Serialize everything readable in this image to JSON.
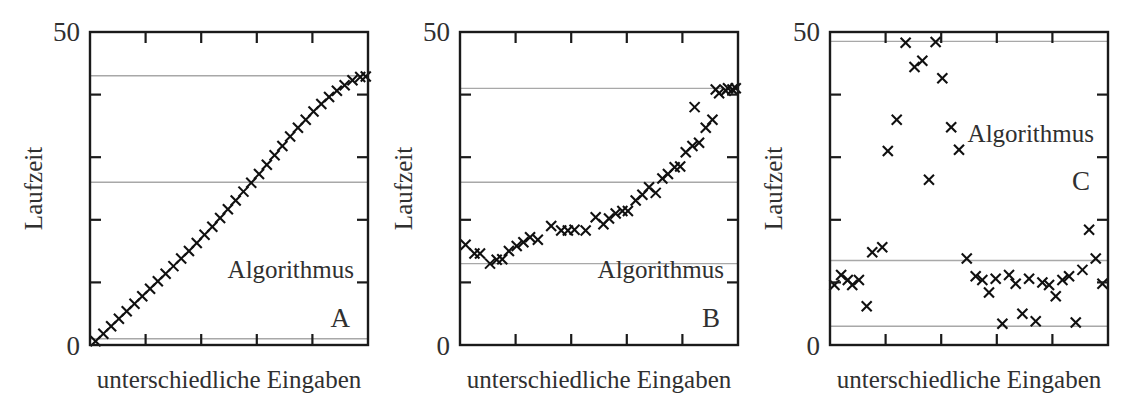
{
  "figure": {
    "panel_count": 3,
    "background_color": "#ffffff",
    "frame_color": "#1a1a1a",
    "gridline_color": "#a8a8a8",
    "marker_color": "#101010",
    "text_color": "#303030"
  },
  "chart_data": [
    {
      "type": "scatter",
      "panel_id": "A",
      "title": "",
      "annotation": "Algorithmus",
      "panel_label": "A",
      "xlabel": "unterschiedliche Eingaben",
      "ylabel": "Laufzeit",
      "ylim": [
        0,
        50
      ],
      "xlim": [
        0,
        50
      ],
      "ytick_labels": [
        "0",
        "50"
      ],
      "ytick_values": [
        0,
        50
      ],
      "ytick_minor_values": [
        10,
        20,
        30,
        40
      ],
      "xtick_count": 6,
      "grid": "horizontal",
      "gridline_values": [
        1,
        26,
        43
      ],
      "marker": "x",
      "x": [
        1,
        2.4,
        3.8,
        5.2,
        6.6,
        8,
        9.4,
        10.8,
        12.2,
        13.6,
        15,
        16.4,
        17.8,
        19.2,
        20.6,
        22,
        23.4,
        24.8,
        26.2,
        27.6,
        29,
        30.4,
        31.8,
        33.2,
        34.6,
        36,
        37.4,
        38.8,
        40.2,
        41.6,
        43,
        44.4,
        45.8,
        47.2,
        48.6,
        49.6
      ],
      "y": [
        0.6,
        1.8,
        3.0,
        4.2,
        5.4,
        6.6,
        7.8,
        9.0,
        10.2,
        11.4,
        12.6,
        13.8,
        15.0,
        16.3,
        17.6,
        18.9,
        20.3,
        21.7,
        23.1,
        24.5,
        25.9,
        27.3,
        28.8,
        30.3,
        31.8,
        33.3,
        34.7,
        36.0,
        37.3,
        38.5,
        39.6,
        40.6,
        41.5,
        42.3,
        42.8,
        42.9
      ]
    },
    {
      "type": "scatter",
      "panel_id": "B",
      "title": "",
      "annotation": "Algorithmus",
      "panel_label": "B",
      "xlabel": "unterschiedliche Eingaben",
      "ylabel": "Laufzeit",
      "ylim": [
        0,
        50
      ],
      "xlim": [
        0,
        50
      ],
      "ytick_labels": [
        "0",
        "50"
      ],
      "ytick_values": [
        0,
        50
      ],
      "ytick_minor_values": [
        10,
        20,
        30,
        40
      ],
      "xtick_count": 6,
      "grid": "horizontal",
      "gridline_values": [
        13,
        26,
        41
      ],
      "marker": "x",
      "x": [
        1.0,
        2.6,
        3.6,
        5.4,
        6.6,
        7.6,
        8.8,
        10.2,
        11.4,
        12.6,
        14.0,
        16.4,
        18.2,
        19.4,
        20.6,
        22.6,
        24.4,
        25.8,
        26.8,
        28.0,
        29.2,
        30.2,
        31.6,
        32.8,
        34.0,
        35.2,
        36.4,
        37.4,
        38.6,
        39.6,
        40.6,
        41.8,
        43.0,
        44.2,
        45.4,
        46.6,
        47.8,
        49.0
      ],
      "y": [
        16.0,
        14.6,
        14.6,
        13.0,
        13.6,
        13.7,
        15.0,
        15.8,
        16.4,
        17.2,
        16.8,
        19.0,
        18.3,
        18.3,
        18.4,
        18.3,
        20.4,
        19.3,
        20.2,
        21.0,
        21.4,
        21.4,
        23.1,
        24.0,
        25.2,
        24.3,
        26.6,
        27.3,
        28.4,
        28.5,
        30.8,
        31.8,
        32.3,
        34.7,
        36.0,
        40.2,
        40.6,
        40.8
      ],
      "extra_x": [
        42.2,
        46.0,
        48.2,
        49.6
      ],
      "extra_y": [
        38.0,
        40.8,
        41.0,
        41.0
      ]
    },
    {
      "type": "scatter",
      "panel_id": "C",
      "title": "",
      "annotation": "Algorithmus",
      "panel_label": "C",
      "xlabel": "unterschiedliche Eingaben",
      "ylabel": "Laufzeit",
      "ylim": [
        0,
        50
      ],
      "xlim": [
        0,
        50
      ],
      "ytick_labels": [
        "0",
        "50"
      ],
      "ytick_values": [
        0,
        50
      ],
      "ytick_minor_values": [
        10,
        20,
        30,
        40
      ],
      "xtick_count": 6,
      "grid": "horizontal",
      "gridline_values": [
        3,
        13.5,
        48.5
      ],
      "marker": "x",
      "x": [
        0.8,
        2.0,
        3.2,
        4.0,
        5.2,
        6.6,
        7.6,
        9.4,
        10.4,
        12.0,
        13.6,
        15.2,
        16.6,
        17.8,
        19.0,
        20.2,
        21.8,
        23.2,
        24.6,
        26.2,
        27.4,
        28.6,
        29.8,
        31.0,
        32.2,
        33.4,
        34.6,
        35.8,
        37.0,
        38.2,
        39.4,
        40.6,
        41.8,
        43.0,
        44.2,
        45.4,
        46.6,
        47.8,
        49.0
      ],
      "y": [
        9.6,
        11.2,
        10.4,
        9.6,
        10.4,
        6.2,
        14.8,
        15.6,
        31.0,
        36.0,
        48.3,
        44.4,
        45.4,
        26.4,
        48.4,
        42.6,
        34.8,
        31.2,
        13.8,
        11.0,
        10.4,
        8.4,
        10.6,
        3.4,
        11.2,
        9.8,
        5.0,
        10.6,
        3.8,
        10.0,
        9.6,
        7.8,
        10.4,
        11.0,
        3.6,
        12.0,
        18.4,
        13.8,
        9.8
      ]
    }
  ]
}
